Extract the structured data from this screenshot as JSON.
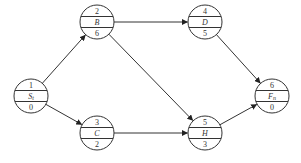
{
  "diagram": {
    "type": "activity-on-node network",
    "nodes": [
      {
        "id": "1",
        "top": "1",
        "name": "St",
        "name_main": "S",
        "name_sub": "t",
        "bottom": "0"
      },
      {
        "id": "2",
        "top": "2",
        "name": "B",
        "name_main": "B",
        "name_sub": "",
        "bottom": "6"
      },
      {
        "id": "3",
        "top": "3",
        "name": "C",
        "name_main": "C",
        "name_sub": "",
        "bottom": "2"
      },
      {
        "id": "4",
        "top": "4",
        "name": "D",
        "name_main": "D",
        "name_sub": "",
        "bottom": "5"
      },
      {
        "id": "5",
        "top": "5",
        "name": "H",
        "name_main": "H",
        "name_sub": "",
        "bottom": "3"
      },
      {
        "id": "6",
        "top": "6",
        "name": "Fn",
        "name_main": "F",
        "name_sub": "n",
        "bottom": "0"
      }
    ],
    "edges": [
      {
        "from": "1",
        "to": "2"
      },
      {
        "from": "1",
        "to": "3"
      },
      {
        "from": "2",
        "to": "4"
      },
      {
        "from": "2",
        "to": "5"
      },
      {
        "from": "3",
        "to": "5"
      },
      {
        "from": "4",
        "to": "6"
      },
      {
        "from": "5",
        "to": "6"
      }
    ],
    "colors": {
      "line": "#333333",
      "background": "#ffffff"
    }
  }
}
